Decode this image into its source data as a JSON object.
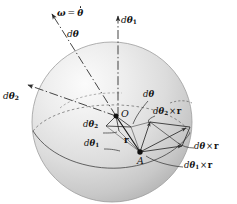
{
  "figure": {
    "name": "angular-velocity-vector-addition-sphere",
    "background_color": "#ffffff",
    "sphere": {
      "fill_light": "#f2f2f2",
      "fill_mid": "#d9d9d9",
      "fill_dark": "#b8b8b8",
      "outline_color": "#9a9a9a",
      "center_x": 112,
      "center_y": 122,
      "radius": 80
    },
    "line_color": "#2b2b2b",
    "points": [
      {
        "id": "O",
        "label": "O",
        "x": 116,
        "y": 116
      },
      {
        "id": "A",
        "label": "A",
        "x": 140,
        "y": 152
      }
    ],
    "labels": {
      "omega_equals_thetadot": {
        "greek_omega": "ω",
        "equals": "=",
        "greek_theta": "θ",
        "accent": "dot"
      },
      "d_theta": {
        "d": "d",
        "theta": "θ"
      },
      "d_theta_1": {
        "d": "d",
        "theta": "θ",
        "sub": "1"
      },
      "d_theta_2": {
        "d": "d",
        "theta": "θ",
        "sub": "2"
      },
      "r": "r",
      "cross": "×",
      "d_theta_cross_r": {
        "d": "d",
        "theta": "θ",
        "times": "×",
        "r": "r"
      },
      "d_theta_1_cross_r": {
        "d": "d",
        "theta": "θ",
        "sub": "1",
        "times": "×",
        "r": "r"
      },
      "d_theta_2_cross_r": {
        "d": "d",
        "theta": "θ",
        "sub": "2",
        "times": "×",
        "r": "r"
      }
    },
    "annotations": [
      {
        "id": "omega-thetadot-label",
        "text": "ω = θ̇",
        "x": 62,
        "y": 16
      },
      {
        "id": "dtheta-upper-label",
        "text": "dθ",
        "x": 70,
        "y": 36
      },
      {
        "id": "dtheta1-top-label",
        "text": "dθ₁",
        "x": 122,
        "y": 22
      },
      {
        "id": "dtheta2-left-label",
        "text": "dθ₂",
        "x": 6,
        "y": 98
      },
      {
        "id": "point-O-label",
        "text": "O",
        "x": 122,
        "y": 113
      },
      {
        "id": "dtheta-center-label",
        "text": "dθ",
        "x": 145,
        "y": 96
      },
      {
        "id": "dtheta2-center-label",
        "text": "dθ₂",
        "x": 86,
        "y": 126
      },
      {
        "id": "dtheta1-center-label",
        "text": "dθ₁",
        "x": 88,
        "y": 144
      },
      {
        "id": "r-label",
        "text": "r",
        "x": 125,
        "y": 142
      },
      {
        "id": "point-A-label",
        "text": "A",
        "x": 138,
        "y": 160
      },
      {
        "id": "dtheta2-cross-r-label",
        "text": "dθ₂ × r",
        "x": 155,
        "y": 113
      },
      {
        "id": "dtheta-cross-r-label",
        "text": "dθ × r",
        "x": 196,
        "y": 148
      },
      {
        "id": "dtheta1-cross-r-label",
        "text": "dθ₁ × r",
        "x": 186,
        "y": 167
      }
    ]
  }
}
